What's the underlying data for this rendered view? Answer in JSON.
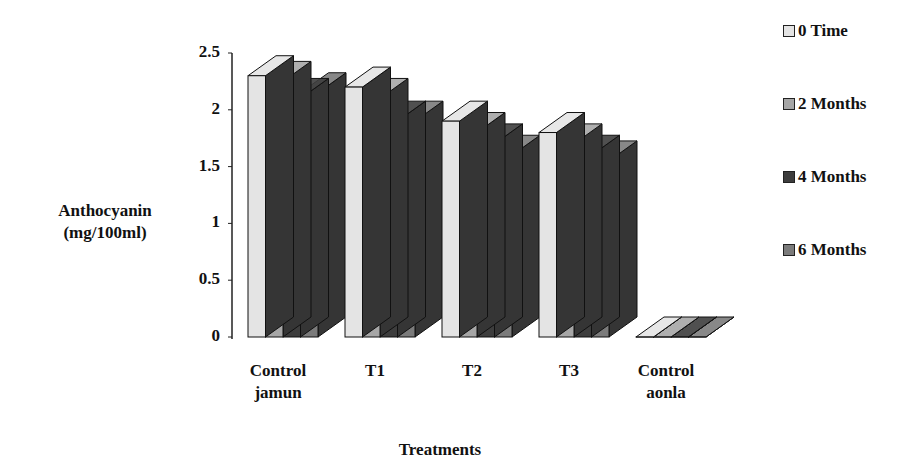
{
  "chart_data": {
    "type": "bar",
    "subtype": "3d-clustered-column",
    "title": "",
    "xlabel": "Treatments",
    "ylabel": [
      "Anthocyanin",
      "(mg/100ml)"
    ],
    "ylim": [
      0,
      2.5
    ],
    "yticks": [
      "0",
      "0.5",
      "1",
      "1.5",
      "2",
      "2.5"
    ],
    "categories": [
      [
        "Control",
        "jamun"
      ],
      [
        "T1"
      ],
      [
        "T2"
      ],
      [
        "T3"
      ],
      [
        "Control",
        "aonla"
      ]
    ],
    "series": [
      {
        "name": "0 Time",
        "color": "#e4e4e4",
        "values": [
          2.3,
          2.2,
          1.9,
          1.8,
          0
        ]
      },
      {
        "name": "2 Months",
        "color": "#a6a6a6",
        "values": [
          2.25,
          2.1,
          1.8,
          1.7,
          0
        ]
      },
      {
        "name": "4 Months",
        "color": "#3d3d3d",
        "values": [
          2.1,
          1.9,
          1.7,
          1.6,
          0
        ]
      },
      {
        "name": "6 Months",
        "color": "#7b7b7b",
        "values": [
          2.15,
          1.9,
          1.6,
          1.55,
          0
        ]
      }
    ],
    "legend_position": "right",
    "grid": false
  },
  "colors": {
    "side_face": "#353535",
    "outline": "#111111",
    "axis": "#222222"
  }
}
